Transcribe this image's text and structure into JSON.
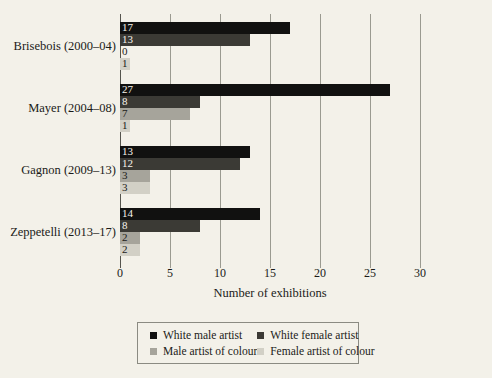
{
  "chart_data": {
    "type": "bar",
    "orientation": "horizontal",
    "title": "",
    "xlabel": "Number of exhibitions",
    "ylabel": "",
    "xlim": [
      0,
      30
    ],
    "xticks": [
      0,
      5,
      10,
      15,
      20,
      25,
      30
    ],
    "xtick_labels": [
      "0",
      "5",
      "10",
      "15",
      "20",
      "25",
      "30"
    ],
    "grid": "vertical",
    "legend_position": "bottom",
    "categories": [
      "Brisebois (2000–04)",
      "Mayer (2004–08)",
      "Gagnon (2009–13)",
      "Zeppetelli (2013–17)"
    ],
    "series": [
      {
        "name": "White male artist",
        "color": "#111110",
        "values": [
          17,
          27,
          13,
          14
        ]
      },
      {
        "name": "White female artist",
        "color": "#3b3a35",
        "values": [
          13,
          8,
          12,
          8
        ]
      },
      {
        "name": "Male artist of colour",
        "color": "#a6a49b",
        "values": [
          0,
          7,
          3,
          2
        ]
      },
      {
        "name": "Female artist of colour",
        "color": "#d2d0c6",
        "values": [
          1,
          1,
          3,
          2
        ]
      }
    ],
    "data_labels": [
      [
        "17",
        "13",
        "0",
        "1"
      ],
      [
        "27",
        "8",
        "7",
        "1"
      ],
      [
        "13",
        "12",
        "3",
        "3"
      ],
      [
        "14",
        "8",
        "2",
        "2"
      ]
    ]
  },
  "legend": {
    "items": [
      {
        "label": "White male artist",
        "color": "#111110"
      },
      {
        "label": "White female artist",
        "color": "#3b3a35"
      },
      {
        "label": "Male artist of colour",
        "color": "#a6a49b"
      },
      {
        "label": "Female artist of colour",
        "color": "#d2d0c6"
      }
    ]
  },
  "colors": {
    "background": "#f3f1e9",
    "gridline": "#9a9a90",
    "axis": "#55554e",
    "text": "#1b1b18",
    "label_on_dark": "#f6f4ec"
  }
}
